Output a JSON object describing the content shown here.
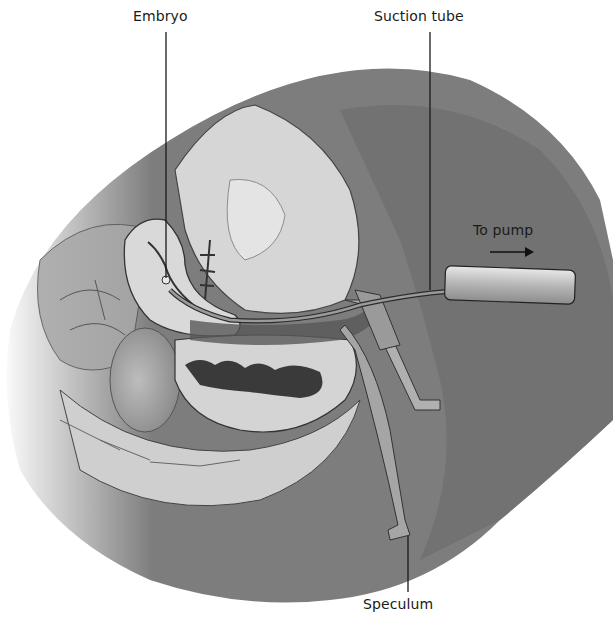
{
  "figure": {
    "type": "anatomical illustration",
    "palette": {
      "background": "#ffffff",
      "skin_dark": "#6e6e6e",
      "skin_mid": "#9a9a9a",
      "tissue_light": "#d9d9d9",
      "cavity_dark": "#3a3a3a",
      "line": "#1a1a1a"
    },
    "labels": {
      "embryo": "Embryo",
      "suction_tube": "Suction tube",
      "to_pump": "To pump",
      "speculum": "Speculum"
    },
    "annotations": [
      {
        "label": "Embryo",
        "x": 133,
        "y": 24,
        "leader_to": [
          168,
          232
        ]
      },
      {
        "label": "Suction tube",
        "x": 374,
        "y": 24,
        "leader_to": [
          430,
          290
        ]
      },
      {
        "label": "To pump",
        "x": 473,
        "y": 224,
        "arrow": "right"
      },
      {
        "label": "Speculum",
        "x": 363,
        "y": 596,
        "leader_from": [
          408,
          536
        ]
      }
    ]
  }
}
